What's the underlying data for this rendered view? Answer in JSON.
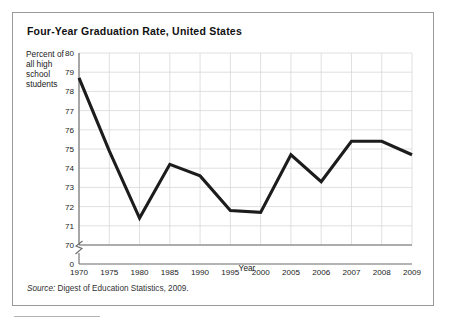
{
  "figure": {
    "title": "Four-Year Graduation Rate, United States",
    "y_axis_title_lines": [
      "Percent of",
      "all high",
      "school",
      "students"
    ],
    "y_axis_title": "Percent of all high school students",
    "x_axis_title": "Year",
    "source_label": "Source:",
    "source_text": " Digest of Education Statistics, 2009.",
    "source_full": "Source: Digest of Education Statistics, 2009.",
    "line_color": "#1c1c1c",
    "grid_color": "#d8d8d8",
    "axis_color": "#6b6b6b",
    "frame_color": "#9a9a9a"
  },
  "chart_data": {
    "type": "line",
    "title": "Four-Year Graduation Rate, United States",
    "xlabel": "Year",
    "ylabel": "Percent of all high school students",
    "categories": [
      "1970",
      "1975",
      "1980",
      "1985",
      "1990",
      "1995",
      "2000",
      "2005",
      "2006",
      "2007",
      "2008",
      "2009"
    ],
    "values": [
      78.7,
      74.9,
      71.4,
      74.2,
      73.6,
      71.8,
      71.7,
      74.7,
      73.3,
      75.4,
      75.4,
      74.7
    ],
    "series": [
      {
        "name": "Four-year graduation rate",
        "values": [
          78.7,
          74.9,
          71.4,
          74.2,
          73.6,
          71.8,
          71.7,
          74.7,
          73.3,
          75.4,
          75.4,
          74.7
        ]
      }
    ],
    "ylim": [
      70,
      80
    ],
    "y_ticks": [
      70,
      71,
      72,
      73,
      74,
      75,
      76,
      77,
      78,
      79,
      80
    ],
    "y_tick_labels": [
      "70",
      "71",
      "72",
      "73",
      "74",
      "75",
      "76",
      "77",
      "78",
      "79",
      "80"
    ],
    "y_axis_break": true,
    "y_axis_origin_label": "0",
    "x_ticks": [
      "1970",
      "1975",
      "1980",
      "1985",
      "1990",
      "1995",
      "2000",
      "2005",
      "2006",
      "2007",
      "2008",
      "2009"
    ],
    "grid": true,
    "legend": "none",
    "annotations": []
  }
}
